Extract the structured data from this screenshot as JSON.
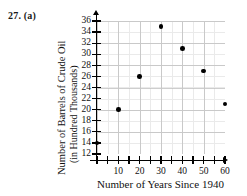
{
  "problem": {
    "label": "27. (a)"
  },
  "chart_data": {
    "type": "scatter",
    "title": "",
    "xlabel": "Number of Years Since 1940",
    "ylabel_line1": "Number of Barrels of Crude Oil",
    "ylabel_line2": "(in Hundred Thousands)",
    "x": [
      0,
      10,
      20,
      30,
      40,
      50,
      60
    ],
    "values": [
      14,
      20,
      26,
      35,
      31,
      27,
      21
    ],
    "points": [
      {
        "x": 0,
        "y": 14
      },
      {
        "x": 10,
        "y": 20
      },
      {
        "x": 20,
        "y": 26
      },
      {
        "x": 30,
        "y": 35
      },
      {
        "x": 40,
        "y": 31
      },
      {
        "x": 50,
        "y": 27
      },
      {
        "x": 60,
        "y": 21
      }
    ],
    "xlim": [
      0,
      60
    ],
    "ylim": [
      12,
      36
    ],
    "xticks": [
      0,
      5,
      10,
      15,
      20,
      25,
      30,
      35,
      40,
      45,
      50,
      55,
      60
    ],
    "xtick_labels": [
      "10",
      "20",
      "30",
      "40",
      "50",
      "60"
    ],
    "xtick_label_values": [
      10,
      20,
      30,
      40,
      50,
      60
    ],
    "yticks": [
      12,
      14,
      16,
      18,
      20,
      22,
      24,
      26,
      28,
      30,
      32,
      34,
      36
    ],
    "ytick_labels": [
      "36",
      "34",
      "32",
      "30",
      "28",
      "26",
      "24",
      "22",
      "20",
      "18",
      "16",
      "14",
      "12"
    ],
    "grid": true,
    "legend": "none",
    "marker_color": "#000000",
    "grid_color": "#d9d9d9",
    "axis_color": "#000000"
  }
}
